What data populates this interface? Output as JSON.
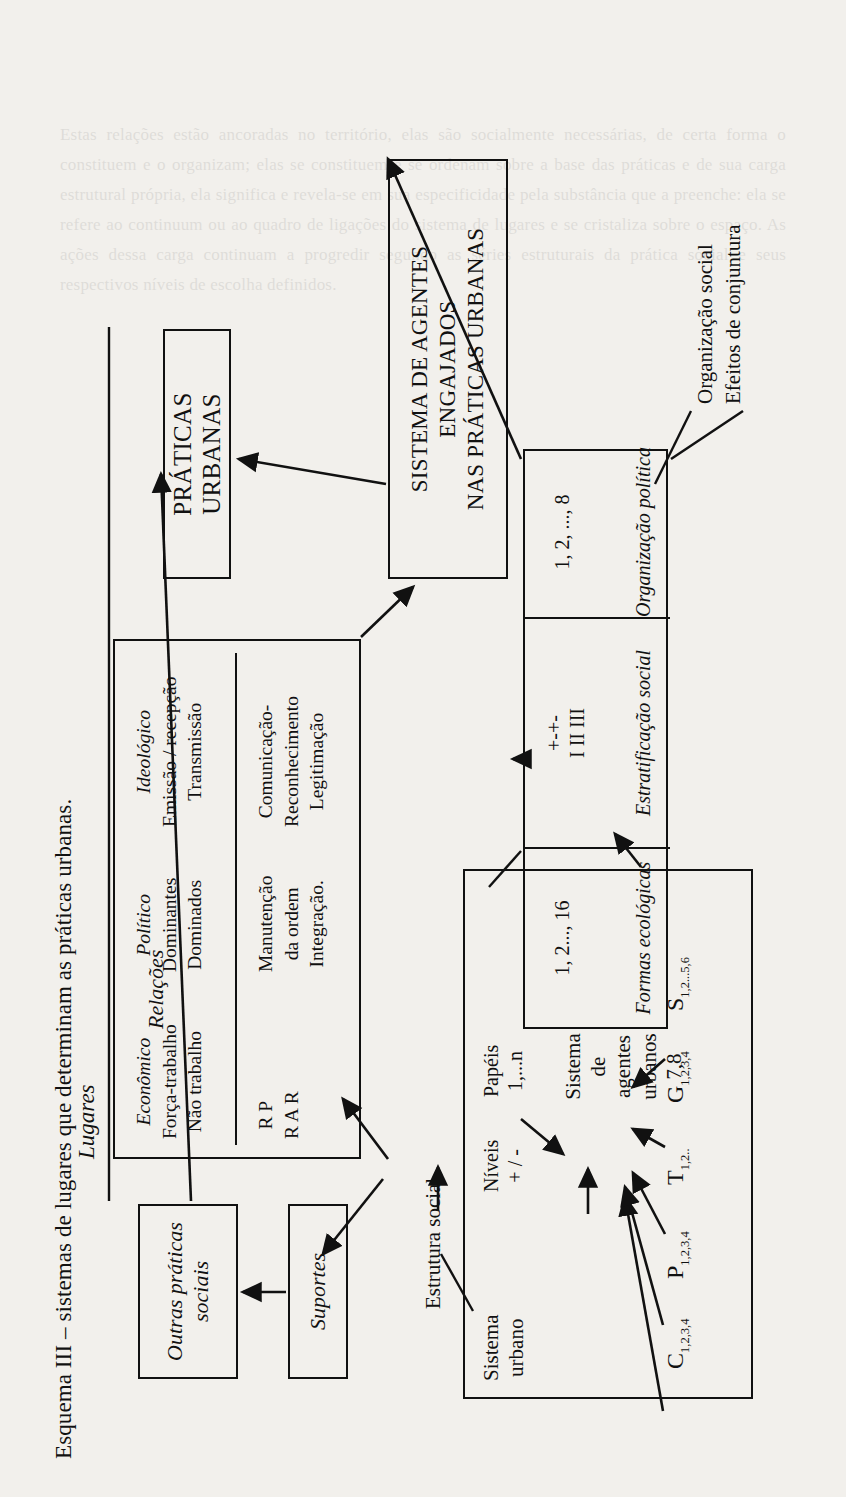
{
  "title": "Esquema III – sistemas de lugares que determinam as práticas urbanas.",
  "boxes": {
    "outras_praticas": "Outras práticas\nsociais",
    "outras_praticas_l1": "Outras práticas",
    "outras_praticas_l2": "sociais",
    "suportes": "Suportes",
    "praticas_urbanas": "PRÁTICAS URBANAS",
    "sistema_agentes_l1": "SISTEMA DE AGENTES",
    "sistema_agentes_l2": "ENGAJADOS",
    "sistema_agentes_l3": "NAS PRÁTICAS URBANAS"
  },
  "labels": {
    "lugares": "Lugares",
    "relacoes": "Relações",
    "estrutura_social": "Estrutura social",
    "organizacao_social": "Organização social",
    "efeitos_conjuntura": "Efeitos de conjuntura"
  },
  "estrutura_social": {
    "columns": [
      {
        "header": "Econômico",
        "lines": [
          "Força-trabalho",
          "Não trabalho"
        ]
      },
      {
        "header": "Político",
        "lines": [
          "Dominantes",
          "Dominados"
        ]
      },
      {
        "header": "Ideológico",
        "lines": [
          "Emissão / recepção",
          "Transmissão"
        ]
      }
    ],
    "row2": [
      {
        "lines": [
          "R P",
          "R A R"
        ]
      },
      {
        "lines": [
          "Manutenção",
          "da ordem",
          "Integração."
        ]
      },
      {
        "lines": [
          "Comunicação-",
          "Reconhecimento",
          "Legitimação"
        ]
      }
    ]
  },
  "coluna_direita": {
    "cells": [
      {
        "num": "1, 2..., 16",
        "caption": "Formas ecológicas"
      },
      {
        "num_top": "+-+-",
        "num_bottom": "I  II  III",
        "caption": "Estratificação social"
      },
      {
        "num": "1, 2, ..., 8",
        "caption": "Organização política"
      }
    ]
  },
  "sistema_urbano": {
    "title_l1": "Sistema",
    "title_l2": "urbano",
    "niveis_l1": "Níveis",
    "niveis_l2": "+ / -",
    "papeis_l1": "Papéis",
    "papeis_l2": "1,...n",
    "center_l1": "Sistema",
    "center_l2": "de",
    "center_l3": "agentes",
    "center_l4": "urbanos",
    "center_l5": "7,8",
    "sources": [
      {
        "letter": "C",
        "sub": "1,2,3,4"
      },
      {
        "letter": "P",
        "sub": "1,2,3,4"
      },
      {
        "letter": "T",
        "sub": "1,2.."
      },
      {
        "letter": "G",
        "sub": "1,2,3,4"
      },
      {
        "letter": "S",
        "sub": "1,2...5,6"
      }
    ]
  },
  "ghost_text": "Estas relações estão ancoradas no território, elas são socialmente necessárias, de certa forma o constituem e o organizam; elas se constituem e se ordenam sobre a base das práticas e de sua carga estrutural própria, ela significa e revela-se em sua especificidade pela substância que a preenche: ela se refere ao continuum ou ao quadro de ligações do sistema de lugares e se cristaliza sobre o espaço. As ações dessa carga continuam a progredir segundo as séries estruturais da prática social e seus respectivos níveis de escolha definidos."
}
